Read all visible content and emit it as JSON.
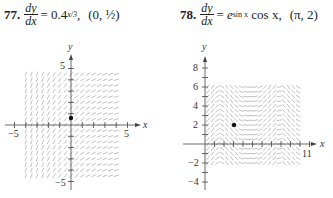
{
  "problems": [
    {
      "number": "77.",
      "lhs_num": "dy",
      "lhs_den": "dx",
      "equals": "=",
      "rhs_base": "0.4",
      "rhs_exp": "x/3",
      "sep": ",",
      "point": "(0, ½)",
      "graph": {
        "x_label": "x",
        "y_label": "y",
        "x_ticks": [
          "−5",
          "5"
        ],
        "y_ticks": [
          "5",
          "−5"
        ],
        "point_coords": [
          0,
          0.5
        ]
      }
    },
    {
      "number": "78.",
      "lhs_num": "dy",
      "lhs_den": "dx",
      "equals": "=",
      "rhs_base": "e",
      "rhs_exp": "sin x",
      "rhs_tail": "cos x,",
      "point": "(π, 2)",
      "graph": {
        "x_label": "x",
        "y_label": "y",
        "x_ticks": [
          "11"
        ],
        "y_ticks": [
          "8",
          "6",
          "4",
          "2",
          "−2",
          "−4"
        ],
        "point_coords": [
          3.14159,
          2
        ]
      }
    }
  ]
}
